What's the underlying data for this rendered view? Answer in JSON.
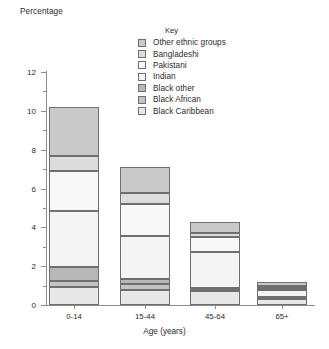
{
  "chart_data": {
    "type": "bar",
    "subtype": "stacked-bar",
    "title": "",
    "xlabel": "Age (years)",
    "ylabel": "Percentage",
    "categories": [
      "0-14",
      "15-44",
      "45-64",
      "65+"
    ],
    "ylim": [
      0,
      12
    ],
    "yticks": [
      0,
      2,
      4,
      6,
      8,
      10,
      12
    ],
    "ytick_labels": [
      "0",
      "2",
      "4",
      "6",
      "8",
      "10",
      "12"
    ],
    "yticks_minor": [
      1,
      3,
      5,
      7,
      9,
      11
    ],
    "grid": false,
    "legend_title": "Key",
    "legend_position": "top-right-inside",
    "stack_order_bottom_to_top": [
      "Black Caribbean",
      "Black African",
      "Black other",
      "Indian",
      "Pakistani",
      "Bangladeshi",
      "Other ethnic groups"
    ],
    "series": [
      {
        "name": "Black Caribbean",
        "color": "#e8e8e8",
        "values": [
          0.95,
          0.75,
          0.7,
          0.3
        ]
      },
      {
        "name": "Black African",
        "color": "#c3c3c3",
        "values": [
          0.3,
          0.35,
          0.1,
          0.05
        ]
      },
      {
        "name": "Black other",
        "color": "#b8b8b8",
        "values": [
          0.7,
          0.25,
          0.08,
          0.05
        ]
      },
      {
        "name": "Indian",
        "color": "#f4f4f4",
        "values": [
          2.9,
          2.2,
          1.85,
          0.35
        ]
      },
      {
        "name": "Pakistani",
        "color": "#f8f8f8",
        "values": [
          2.05,
          1.65,
          0.75,
          0.15
        ]
      },
      {
        "name": "Bangladeshi",
        "color": "#dcdcdc",
        "values": [
          0.8,
          0.55,
          0.25,
          0.1
        ]
      },
      {
        "name": "Other ethnic groups",
        "color": "#c9c9c9",
        "values": [
          2.5,
          1.35,
          0.52,
          0.2
        ]
      }
    ],
    "totals": [
      10.2,
      7.1,
      4.25,
      1.2
    ]
  },
  "legend": {
    "title": "Key",
    "items": [
      {
        "label": "Other ethnic groups",
        "color": "#c9c9c9"
      },
      {
        "label": "Bangladeshi",
        "color": "#dcdcdc"
      },
      {
        "label": "Pakistani",
        "color": "#f8f8f8"
      },
      {
        "label": "Indian",
        "color": "#f4f4f4"
      },
      {
        "label": "Black other",
        "color": "#b8b8b8"
      },
      {
        "label": "Black African",
        "color": "#c3c3c3"
      },
      {
        "label": "Black Caribbean",
        "color": "#e8e8e8"
      }
    ]
  },
  "axes": {
    "y_title": "Percentage",
    "x_title": "Age (years)"
  },
  "colors": {
    "axis": "#8d8d8d",
    "segment_border": "#6f6f6f",
    "text": "#2b2b2b",
    "background": "#ffffff"
  }
}
